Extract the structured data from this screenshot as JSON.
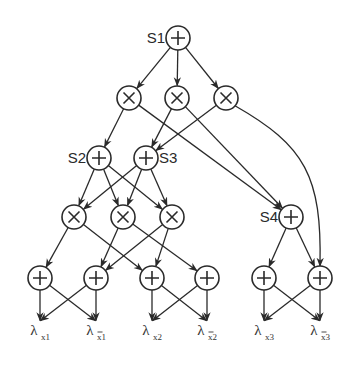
{
  "diagram": {
    "type": "sum-product network",
    "colors": {
      "stroke": "#2a2a2a",
      "background": "#ffffff"
    },
    "node_radius": 12,
    "nodes": [
      {
        "id": "S1",
        "op": "sum",
        "label": "S1",
        "x": 178,
        "y": 38,
        "label_side": "left"
      },
      {
        "id": "P1",
        "op": "product",
        "x": 129,
        "y": 98
      },
      {
        "id": "P2",
        "op": "product",
        "x": 177,
        "y": 98
      },
      {
        "id": "P3",
        "op": "product",
        "x": 226,
        "y": 98
      },
      {
        "id": "S2",
        "op": "sum",
        "label": "S2",
        "x": 99,
        "y": 158,
        "label_side": "left"
      },
      {
        "id": "S3",
        "op": "sum",
        "label": "S3",
        "x": 146,
        "y": 158,
        "label_side": "right"
      },
      {
        "id": "Q1",
        "op": "product",
        "x": 74,
        "y": 217
      },
      {
        "id": "Q2",
        "op": "product",
        "x": 123,
        "y": 217
      },
      {
        "id": "Q3",
        "op": "product",
        "x": 172,
        "y": 217
      },
      {
        "id": "S4",
        "op": "sum",
        "label": "S4",
        "x": 291,
        "y": 217,
        "label_side": "left"
      },
      {
        "id": "L1",
        "op": "sum",
        "x": 40,
        "y": 278
      },
      {
        "id": "L2",
        "op": "sum",
        "x": 96,
        "y": 278
      },
      {
        "id": "L3",
        "op": "sum",
        "x": 152,
        "y": 278
      },
      {
        "id": "L4",
        "op": "sum",
        "x": 207,
        "y": 278
      },
      {
        "id": "L5",
        "op": "sum",
        "x": 264,
        "y": 278
      },
      {
        "id": "L6",
        "op": "sum",
        "x": 320,
        "y": 278
      }
    ],
    "indicators": [
      {
        "id": "lx1",
        "base": "λ",
        "sub": "x1",
        "bar": false,
        "x": 40,
        "y": 335
      },
      {
        "id": "lnx1",
        "base": "λ",
        "sub": "x̄1",
        "bar": true,
        "x": 96,
        "y": 335
      },
      {
        "id": "lx2",
        "base": "λ",
        "sub": "x2",
        "bar": false,
        "x": 152,
        "y": 335
      },
      {
        "id": "lnx2",
        "base": "λ",
        "sub": "x̄2",
        "bar": true,
        "x": 207,
        "y": 335
      },
      {
        "id": "lx3",
        "base": "λ",
        "sub": "x3",
        "bar": false,
        "x": 264,
        "y": 335
      },
      {
        "id": "lnx3",
        "base": "λ",
        "sub": "x̄3",
        "bar": true,
        "x": 320,
        "y": 335
      }
    ],
    "edges": [
      [
        "S1",
        "P1"
      ],
      [
        "S1",
        "P2"
      ],
      [
        "S1",
        "P3"
      ],
      [
        "P1",
        "S2"
      ],
      [
        "P1",
        "S4"
      ],
      [
        "P2",
        "S3"
      ],
      [
        "P2",
        "S4"
      ],
      [
        "P3",
        "S3"
      ],
      [
        "P3",
        "L6",
        "curve"
      ],
      [
        "S2",
        "Q1"
      ],
      [
        "S2",
        "Q2"
      ],
      [
        "S2",
        "Q3"
      ],
      [
        "S3",
        "Q1"
      ],
      [
        "S3",
        "Q2"
      ],
      [
        "S3",
        "Q3"
      ],
      [
        "Q1",
        "L1"
      ],
      [
        "Q1",
        "L3"
      ],
      [
        "Q2",
        "L2"
      ],
      [
        "Q2",
        "L4"
      ],
      [
        "Q3",
        "L2"
      ],
      [
        "Q3",
        "L3"
      ],
      [
        "S4",
        "L5"
      ],
      [
        "S4",
        "L6"
      ],
      [
        "L1",
        "lx1"
      ],
      [
        "L1",
        "lnx1"
      ],
      [
        "L2",
        "lx1"
      ],
      [
        "L2",
        "lnx1"
      ],
      [
        "L3",
        "lx2"
      ],
      [
        "L3",
        "lnx2"
      ],
      [
        "L4",
        "lx2"
      ],
      [
        "L4",
        "lnx2"
      ],
      [
        "L5",
        "lx3"
      ],
      [
        "L5",
        "lnx3"
      ],
      [
        "L6",
        "lx3"
      ],
      [
        "L6",
        "lnx3"
      ]
    ]
  }
}
